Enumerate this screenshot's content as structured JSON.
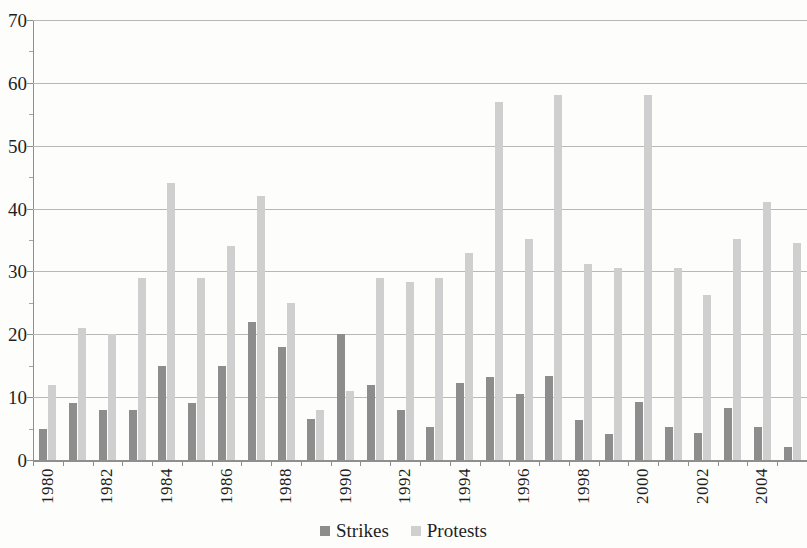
{
  "chart_data": {
    "type": "bar",
    "title": "",
    "subtitle": "",
    "xlabel": "",
    "ylabel": "",
    "ylim": [
      0,
      70
    ],
    "y_ticks": [
      0,
      10,
      20,
      30,
      40,
      50,
      60,
      70
    ],
    "grid": true,
    "legend_position": "bottom",
    "x": [
      1980,
      1981,
      1982,
      1983,
      1984,
      1985,
      1986,
      1987,
      1988,
      1989,
      1990,
      1991,
      1992,
      1993,
      1994,
      1995,
      1996,
      1997,
      1998,
      1999,
      2000,
      2001,
      2002,
      2003,
      2004,
      2005
    ],
    "categories": [
      "1980",
      "1981",
      "1982",
      "1983",
      "1984",
      "1985",
      "1986",
      "1987",
      "1988",
      "1989",
      "1990",
      "1991",
      "1992",
      "1993",
      "1994",
      "1995",
      "1996",
      "1997",
      "1998",
      "1999",
      "2000",
      "2001",
      "2002",
      "2003",
      "2004",
      "2005"
    ],
    "x_tick_labels": [
      "1980",
      "1982",
      "1984",
      "1986",
      "1988",
      "1990",
      "1992",
      "1994",
      "1996",
      "1998",
      "2000",
      "2002",
      "2004"
    ],
    "series": [
      {
        "name": "Strikes",
        "color": "#8d8d8d",
        "values": [
          5,
          9,
          8,
          8,
          15,
          9,
          15,
          22,
          18,
          6.5,
          20,
          12,
          8,
          5.3,
          12.2,
          13.2,
          10.5,
          13.3,
          6.3,
          4.2,
          9.3,
          5.2,
          4.3,
          8.2,
          5.2,
          2
        ]
      },
      {
        "name": "Protests",
        "color": "#cfcfcf",
        "values": [
          12,
          21,
          20,
          29,
          44,
          29,
          34,
          42,
          25,
          8,
          11,
          29,
          28.3,
          29,
          33,
          57,
          35.2,
          58,
          31.2,
          30.5,
          58,
          30.5,
          26.2,
          35.2,
          41,
          34.5
        ]
      }
    ]
  },
  "legend": {
    "items": [
      {
        "label": "Strikes",
        "swatch": "strikes-swatch",
        "color": "#8d8d8d"
      },
      {
        "label": "Protests",
        "swatch": "protests-swatch",
        "color": "#cfcfcf"
      }
    ]
  },
  "axis": {
    "y_labels": [
      "70",
      "60",
      "50",
      "40",
      "30",
      "20",
      "10",
      "0"
    ]
  }
}
